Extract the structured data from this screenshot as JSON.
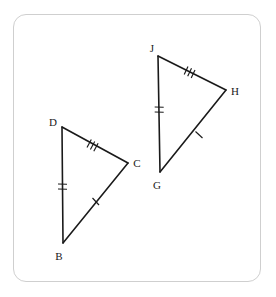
{
  "figure": {
    "background_color": "#ffffff",
    "frame": {
      "border_color": "#cfcfcf",
      "corner_radius": "13",
      "style": "rounded-rectangle"
    },
    "stroke_color": "#1a1a1a",
    "triangles": [
      {
        "name": "triangle-dbc",
        "vertices": [
          {
            "label": "D",
            "x": 62,
            "y": 127,
            "label_x": 53,
            "label_y": 126
          },
          {
            "label": "B",
            "x": 63,
            "y": 243,
            "label_x": 58,
            "label_y": 259
          },
          {
            "label": "C",
            "x": 128,
            "y": 163,
            "label_x": 134,
            "label_y": 166
          }
        ],
        "sides": [
          {
            "name": "side-DC",
            "from": "D",
            "to": "C",
            "ticks": 3
          },
          {
            "name": "side-DB",
            "from": "D",
            "to": "B",
            "ticks": 2
          },
          {
            "name": "side-BC",
            "from": "B",
            "to": "C",
            "ticks": 1
          }
        ]
      },
      {
        "name": "triangle-jgh",
        "vertices": [
          {
            "label": "J",
            "x": 158,
            "y": 56,
            "label_x": 150,
            "label_y": 52
          },
          {
            "label": "G",
            "x": 160,
            "y": 172,
            "label_x": 155,
            "label_y": 188
          },
          {
            "label": "H",
            "x": 226,
            "y": 90,
            "label_x": 232,
            "label_y": 94
          }
        ],
        "sides": [
          {
            "name": "side-JH",
            "from": "J",
            "to": "H",
            "ticks": 3
          },
          {
            "name": "side-JG",
            "from": "J",
            "to": "G",
            "ticks": 2
          },
          {
            "name": "side-GH",
            "from": "G",
            "to": "H",
            "ticks": 1
          }
        ]
      }
    ],
    "labels": {
      "D": "D",
      "B": "B",
      "C": "C",
      "J": "J",
      "G": "G",
      "H": "H"
    }
  }
}
